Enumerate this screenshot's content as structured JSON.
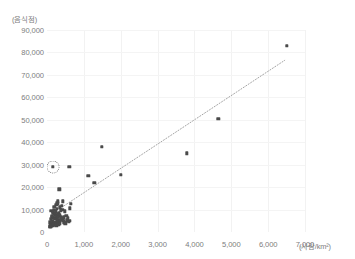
{
  "chart_data": {
    "type": "scatter",
    "title": "",
    "subtitle": "",
    "xlabel": "(사람/km²)",
    "ylabel": "(음식점)",
    "xlim": [
      0,
      7000
    ],
    "ylim": [
      0,
      90000
    ],
    "xticks": [
      "0",
      "1,000",
      "2,000",
      "3,000",
      "4,000",
      "5,000",
      "6,000",
      "7,000"
    ],
    "xtick_values": [
      0,
      1000,
      2000,
      3000,
      4000,
      5000,
      6000,
      7000
    ],
    "yticks": [
      "0",
      "10,000",
      "20,000",
      "30,000",
      "40,000",
      "50,000",
      "60,000",
      "70,000",
      "80,000",
      "90,000"
    ],
    "ytick_values": [
      0,
      10000,
      20000,
      30000,
      40000,
      50000,
      60000,
      70000,
      80000,
      90000
    ],
    "grid": true,
    "legend": null,
    "marker_color": "#4a4a4a",
    "trendline_color": "#9a9a9a",
    "trendline": {
      "style": "dotted",
      "x_start": 400,
      "y_start": 11000,
      "x_end": 6450,
      "y_end": 76500
    },
    "annotations": [
      {
        "type": "circle-highlight",
        "x": 150,
        "y": 29000,
        "style": "dotted"
      }
    ],
    "points": [
      [
        6500,
        83000
      ],
      [
        4650,
        50500
      ],
      [
        3800,
        35000
      ],
      [
        1480,
        38000
      ],
      [
        2000,
        25500
      ],
      [
        1120,
        25000
      ],
      [
        1280,
        22000
      ],
      [
        610,
        29000
      ],
      [
        150,
        29000
      ],
      [
        330,
        19000
      ],
      [
        300,
        13700
      ],
      [
        430,
        13600
      ],
      [
        640,
        12500
      ],
      [
        620,
        10500
      ],
      [
        250,
        12000
      ],
      [
        200,
        11200
      ],
      [
        350,
        11000
      ],
      [
        420,
        9800
      ],
      [
        480,
        9200
      ],
      [
        530,
        5200
      ],
      [
        600,
        5000
      ],
      [
        120,
        9500
      ],
      [
        160,
        8800
      ],
      [
        185,
        8200
      ],
      [
        210,
        7900
      ],
      [
        235,
        7600
      ],
      [
        260,
        7300
      ],
      [
        280,
        7000
      ],
      [
        300,
        6800
      ],
      [
        140,
        6600
      ],
      [
        175,
        6400
      ],
      [
        195,
        6200
      ],
      [
        215,
        6000
      ],
      [
        240,
        5800
      ],
      [
        265,
        5600
      ],
      [
        290,
        5400
      ],
      [
        310,
        5200
      ],
      [
        330,
        5000
      ],
      [
        355,
        4800
      ],
      [
        130,
        4600
      ],
      [
        155,
        4400
      ],
      [
        180,
        4200
      ],
      [
        205,
        4100
      ],
      [
        230,
        4000
      ],
      [
        255,
        3900
      ],
      [
        275,
        3800
      ],
      [
        110,
        5900
      ],
      [
        125,
        7100
      ],
      [
        145,
        5100
      ],
      [
        165,
        9000
      ],
      [
        190,
        10000
      ],
      [
        220,
        8500
      ],
      [
        245,
        9300
      ],
      [
        270,
        10200
      ],
      [
        295,
        8000
      ],
      [
        320,
        8600
      ],
      [
        345,
        7400
      ],
      [
        370,
        6900
      ],
      [
        390,
        6200
      ],
      [
        410,
        5500
      ],
      [
        440,
        4900
      ],
      [
        460,
        6500
      ],
      [
        380,
        9600
      ],
      [
        400,
        11800
      ],
      [
        280,
        12800
      ],
      [
        90,
        4300
      ],
      [
        100,
        3500
      ],
      [
        115,
        3200
      ],
      [
        135,
        3000
      ],
      [
        150,
        2800
      ],
      [
        170,
        3300
      ],
      [
        200,
        3600
      ],
      [
        225,
        3100
      ],
      [
        250,
        2900
      ],
      [
        310,
        3400
      ],
      [
        340,
        3700
      ],
      [
        70,
        2600
      ],
      [
        85,
        2400
      ],
      [
        105,
        2200
      ],
      [
        470,
        4200
      ],
      [
        500,
        3900
      ],
      [
        520,
        7200
      ],
      [
        560,
        6100
      ],
      [
        590,
        4500
      ]
    ]
  }
}
